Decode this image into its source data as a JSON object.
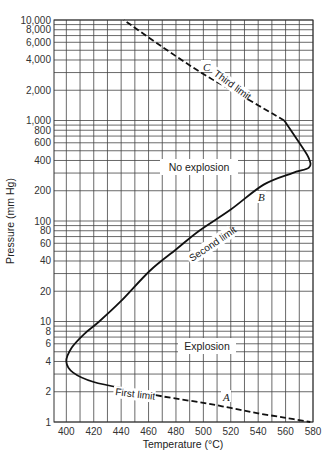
{
  "chart_data": {
    "type": "line",
    "title": "",
    "xlabel": "Temperature (°C)",
    "ylabel": "Pressure (mm Hg)",
    "xlim": [
      391,
      580
    ],
    "ylim": [
      1,
      10000
    ],
    "yscale": "log",
    "grid": true,
    "x_ticks": [
      400,
      420,
      440,
      460,
      480,
      500,
      520,
      540,
      560,
      580
    ],
    "y_ticks": [
      1,
      2,
      4,
      6,
      8,
      10,
      20,
      40,
      60,
      80,
      100,
      200,
      400,
      600,
      800,
      1000,
      2000,
      4000,
      6000,
      8000,
      10000
    ],
    "y_tick_labels": [
      "1",
      "2",
      "4",
      "6",
      "8",
      "10",
      "20",
      "40",
      "60",
      "80",
      "100",
      "200",
      "400",
      "600",
      "800",
      "1,000",
      "2,000",
      "4,000",
      "6,000",
      "8,000",
      "10,000"
    ],
    "series": [
      {
        "name": "First limit",
        "letter": "A",
        "style": "dashed",
        "points": [
          [
            446,
            2.1
          ],
          [
            470,
            1.8
          ],
          [
            500,
            1.55
          ],
          [
            520,
            1.38
          ],
          [
            540,
            1.22
          ],
          [
            560,
            1.1
          ],
          [
            578,
            1.0
          ]
        ]
      },
      {
        "name": "Second limit",
        "letter": "B",
        "style": "solid",
        "points": [
          [
            446,
            2.1
          ],
          [
            420,
            2.5
          ],
          [
            405,
            3.1
          ],
          [
            400,
            4.0
          ],
          [
            404,
            5.5
          ],
          [
            413,
            7.5
          ],
          [
            424,
            10
          ],
          [
            440,
            16
          ],
          [
            461,
            32
          ],
          [
            480,
            52
          ],
          [
            497,
            80
          ],
          [
            520,
            130
          ],
          [
            544,
            230
          ],
          [
            565,
            300
          ],
          [
            577,
            340
          ],
          [
            577,
            420
          ],
          [
            570,
            600
          ],
          [
            559,
            1000
          ]
        ]
      },
      {
        "name": "Third limit",
        "letter": "C",
        "style": "dashed",
        "points": [
          [
            559,
            1000
          ],
          [
            530,
            1700
          ],
          [
            500,
            2900
          ],
          [
            470,
            5400
          ],
          [
            442,
            10000
          ]
        ]
      }
    ],
    "annotations": [
      {
        "text": "No explosion",
        "x": 515,
        "y": 300
      },
      {
        "text": "Explosion",
        "x": 520,
        "y": 5
      },
      {
        "text": "First limit",
        "along": "First limit"
      },
      {
        "text": "Second limit",
        "along": "Second limit"
      },
      {
        "text": "Third limit",
        "along": "Third limit"
      },
      {
        "text": "A",
        "x": 516,
        "y": 1.5
      },
      {
        "text": "B",
        "x": 543,
        "y": 160
      },
      {
        "text": "C",
        "x": 508,
        "y": 2600
      }
    ]
  },
  "labels": {
    "xlabel": "Temperature (°C)",
    "ylabel": "Pressure (mm Hg)",
    "no_explosion": "No explosion",
    "explosion": "Explosion",
    "first_limit": "First limit",
    "second_limit": "Second limit",
    "third_limit": "Third limit",
    "letter_a": "A",
    "letter_b": "B",
    "letter_c": "C"
  }
}
